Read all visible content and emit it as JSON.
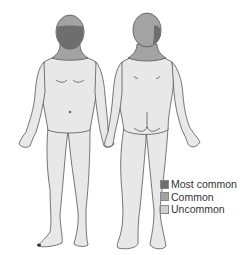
{
  "figure": {
    "front_view": "front-body-figure",
    "back_view": "back-body-figure"
  },
  "colors": {
    "most_common": "#6e6e6e",
    "common": "#a3a3a3",
    "uncommon": "#cfcfcf",
    "body_fill": "#e8e8e8",
    "outline": "#555555"
  },
  "legend": {
    "items": [
      {
        "label": "Most common",
        "color": "#6e6e6e"
      },
      {
        "label": "Common",
        "color": "#a3a3a3"
      },
      {
        "label": "Uncommon",
        "color": "#cfcfcf"
      }
    ]
  }
}
